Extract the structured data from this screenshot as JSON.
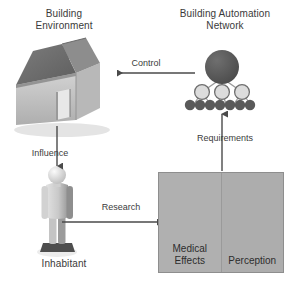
{
  "diagram": {
    "background_color": "#ffffff",
    "nodes": {
      "building_environment": {
        "label": "Building\nEnvironment",
        "icon": "isometric-house-icon"
      },
      "building_automation_network": {
        "label": "Building Automation\nNetwork",
        "icon": "network-tree-icon",
        "root_nodes": 1,
        "middle_nodes": 3,
        "leaf_nodes": 7
      },
      "inhabitant": {
        "label": "Inhabitant",
        "icon": "person-figure-icon"
      },
      "research_panel": {
        "left": {
          "label": "Medical\nEffects",
          "icon": "medical-cross-speech-bubble-icon"
        },
        "right": {
          "label": "Perception",
          "icon": "info-speech-bubble-icon"
        }
      }
    },
    "edges": [
      {
        "name": "control",
        "label": "Control",
        "from": "building_automation_network",
        "to": "building_environment",
        "direction": "left"
      },
      {
        "name": "influence",
        "label": "Influence",
        "from": "building_environment",
        "to": "inhabitant",
        "direction": "down"
      },
      {
        "name": "research",
        "label": "Research",
        "from": "inhabitant",
        "to": "research_panel",
        "direction": "right"
      },
      {
        "name": "requirements",
        "label": "Requirements",
        "from": "research_panel",
        "to": "building_automation_network",
        "direction": "up"
      }
    ],
    "colors": {
      "text": "#3a3a3a",
      "arrow": "#4a4a4a",
      "panel_fill": "#b3b3b3",
      "panel_border": "#8e8e8e",
      "icon_dark": "#5a5a5a",
      "node_dark": "#555555",
      "node_light": "#d9d9d9",
      "roof_dark": "#6e6e6e",
      "wall_light": "#c6c6c6"
    }
  }
}
